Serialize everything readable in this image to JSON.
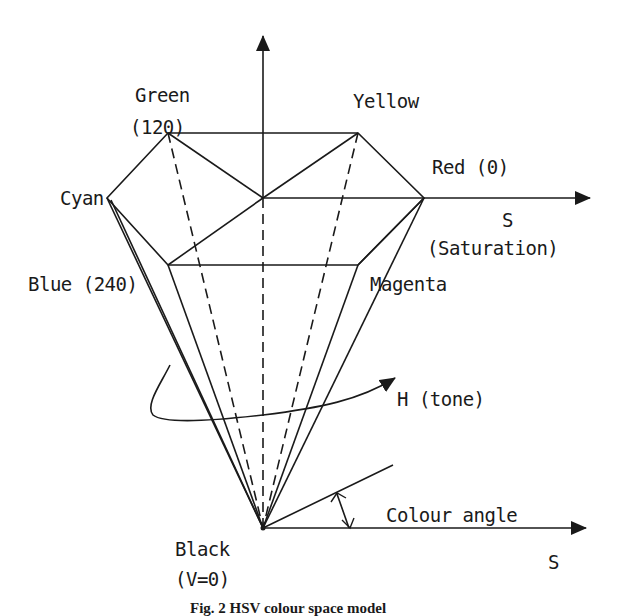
{
  "figure": {
    "caption": "Fig. 2  HSV colour space model",
    "line_color": "#1a1a1a"
  },
  "labels": {
    "green": "Green",
    "green_value": "(120)",
    "yellow": "Yellow",
    "red": "Red (0)",
    "cyan": "Cyan",
    "blue": "Blue (240)",
    "magenta": "Magenta",
    "s_axis_top": "S",
    "saturation": "(Saturation)",
    "hue": "H (tone)",
    "black": "Black",
    "black_value": "(V=0)",
    "colour_angle": "Colour angle",
    "s_axis_bottom": "S"
  },
  "geometry": {
    "apex_black": [
      263,
      528
    ],
    "hexagon_center": [
      263,
      198
    ],
    "vertices": {
      "green": [
        168,
        133
      ],
      "yellow": [
        358,
        133
      ],
      "red": [
        424,
        198
      ],
      "magenta": [
        358,
        265
      ],
      "blue": [
        168,
        265
      ],
      "cyan": [
        107,
        198
      ]
    }
  }
}
